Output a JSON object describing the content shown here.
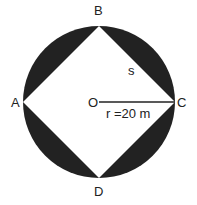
{
  "diagram": {
    "points": {
      "A": "A",
      "B": "B",
      "C": "C",
      "D": "D",
      "O": "O"
    },
    "side_label": "s",
    "radius_label": "r =20 m",
    "colors": {
      "segment_fill": "#222222",
      "square_fill": "#ffffff",
      "line": "#222222"
    }
  }
}
